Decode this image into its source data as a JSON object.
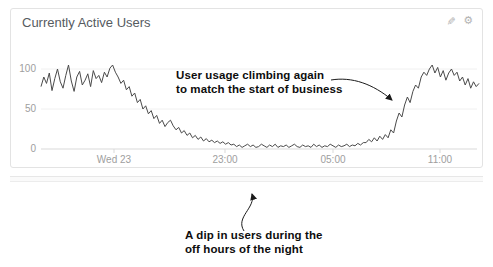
{
  "panel": {
    "title": "Currently Active Users",
    "actions": [
      {
        "name": "edit-icon",
        "glyph": "✎"
      },
      {
        "name": "gear-icon",
        "glyph": "⚙"
      }
    ]
  },
  "chart_data": {
    "type": "line",
    "title": "Currently Active Users",
    "x_axis": {
      "tick_labels": [
        "Wed 23",
        "23:00",
        "05:00",
        "11:00"
      ],
      "tick_interval_hours": 6,
      "grid": false
    },
    "y_axis": {
      "ticks": [
        0,
        50,
        100
      ],
      "tick_labels": [
        "0",
        "50",
        "100"
      ],
      "range": [
        0,
        130
      ],
      "grid": true
    },
    "series": [
      {
        "name": "Currently Active Users",
        "color": "#4a4a4a",
        "values": [
          78,
          90,
          82,
          95,
          73,
          88,
          100,
          84,
          76,
          92,
          105,
          85,
          72,
          90,
          97,
          80,
          86,
          94,
          78,
          98,
          88,
          92,
          83,
          96,
          90,
          101,
          105,
          96,
          90,
          82,
          86,
          74,
          78,
          66,
          70,
          58,
          62,
          50,
          54,
          44,
          48,
          38,
          42,
          32,
          36,
          28,
          33,
          36,
          29,
          24,
          27,
          20,
          23,
          17,
          20,
          14,
          17,
          12,
          15,
          10,
          13,
          9,
          11,
          8,
          10,
          7,
          9,
          6,
          8,
          5,
          6,
          3,
          5,
          2,
          4,
          6,
          3,
          5,
          2,
          3,
          6,
          4,
          2,
          5,
          3,
          6,
          2,
          4,
          3,
          5,
          2,
          4,
          6,
          3,
          2,
          5,
          3,
          4,
          2,
          6,
          3,
          5,
          2,
          4,
          3,
          6,
          4,
          2,
          5,
          3,
          4,
          6,
          3,
          5,
          4,
          7,
          5,
          8,
          8,
          12,
          9,
          14,
          10,
          16,
          12,
          18,
          14,
          24,
          20,
          35,
          45,
          40,
          55,
          65,
          58,
          72,
          80,
          76,
          90,
          96,
          92,
          100,
          105,
          95,
          102,
          90,
          98,
          86,
          95,
          100,
          92,
          96,
          85,
          90,
          80,
          88,
          76,
          84,
          78,
          82
        ]
      }
    ],
    "annotations": [
      {
        "id": "top",
        "line1": "User usage climbing again",
        "line2": "to match the start of business",
        "points_to": "rising slope before 11:00"
      },
      {
        "id": "bottom",
        "line1": "A dip in users during the",
        "line2": "off hours of the night",
        "points_to": "low plateau during the night"
      }
    ]
  },
  "colors": {
    "line": "#4a4a4a",
    "axis": "#d9d9d9",
    "grid": "#f0f0f0",
    "axis_label": "#9e9e9e",
    "title": "#565b5f",
    "header_icons": "#b3b3b3",
    "panel_border": "#e3e3e3",
    "annotation_text": "#0d0d0d",
    "annotation_arrow": "#1a1a1a"
  }
}
